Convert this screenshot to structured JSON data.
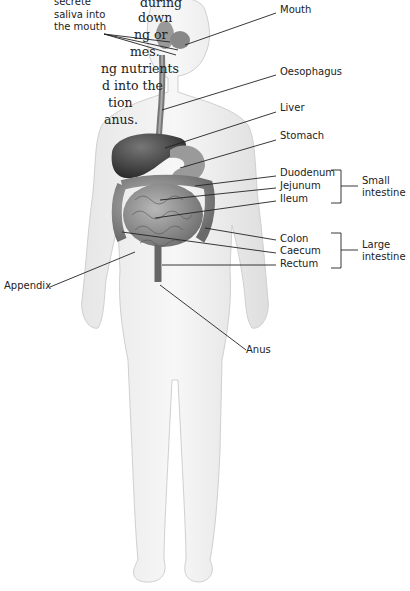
{
  "intro_text": {
    "lines": [
      "during",
      "down",
      "ng or",
      "mes.",
      "ng nutrients",
      "d into the",
      "tion",
      "anus."
    ]
  },
  "callout_top": {
    "lines": [
      "secrete",
      "saliva into",
      "the mouth"
    ]
  },
  "labels": {
    "mouth": "Mouth",
    "oesophagus": "Oesophagus",
    "liver": "Liver",
    "stomach": "Stomach",
    "duodenum": "Duodenum",
    "jejunum": "Jejunum",
    "ileum": "Ileum",
    "colon": "Colon",
    "caecum": "Caecum",
    "rectum": "Rectum",
    "appendix": "Appendix",
    "anus": "Anus"
  },
  "groups": {
    "small_intestine": [
      "Small",
      "intestine"
    ],
    "large_intestine": [
      "Large",
      "intestine"
    ]
  }
}
